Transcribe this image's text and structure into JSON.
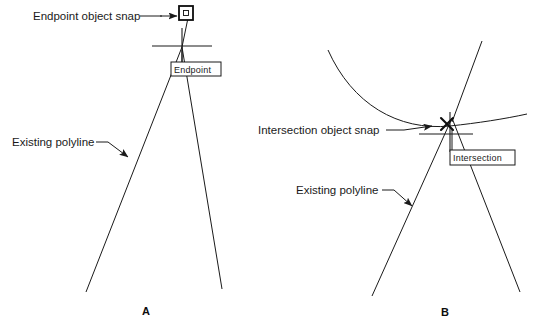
{
  "figure": {
    "ink_color": "#1a1a1a",
    "background": "#ffffff"
  },
  "panels": [
    {
      "id": "A",
      "caption": "A",
      "snap_type": "Endpoint",
      "marker_shape": "square",
      "tooltip_label": "Endpoint",
      "annotations": [
        {
          "label": "Endpoint object snap",
          "points_to": "endpoint-marker"
        },
        {
          "label": "Existing polyline",
          "points_to": "polyline-left-leg"
        }
      ]
    },
    {
      "id": "B",
      "caption": "B",
      "snap_type": "Intersection",
      "marker_shape": "x-cross",
      "tooltip_label": "Intersection",
      "annotations": [
        {
          "label": "Intersection object snap",
          "points_to": "intersection-marker"
        },
        {
          "label": "Existing polyline",
          "points_to": "polyline-left-leg"
        }
      ]
    }
  ],
  "labels": {
    "endpoint_object_snap": "Endpoint object snap",
    "intersection_object_snap": "Intersection object snap",
    "existing_polyline_a": "Existing polyline",
    "existing_polyline_b": "Existing polyline",
    "tooltip_endpoint": "Endpoint",
    "tooltip_intersection": "Intersection",
    "caption_a": "A",
    "caption_b": "B"
  }
}
